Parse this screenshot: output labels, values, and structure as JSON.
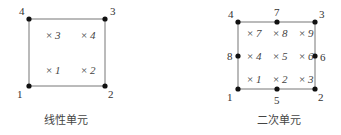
{
  "linear": {
    "caption": "线性单元",
    "nodes": [
      {
        "id": "1",
        "x": 29,
        "y": 86,
        "lx": 17,
        "ly": 98
      },
      {
        "id": "2",
        "x": 105,
        "y": 86,
        "lx": 108,
        "ly": 98
      },
      {
        "id": "3",
        "x": 105,
        "y": 19,
        "lx": 110,
        "ly": 15
      },
      {
        "id": "4",
        "x": 29,
        "y": 19,
        "lx": 19,
        "ly": 15
      }
    ],
    "integration_points": [
      {
        "id": "1",
        "x": 46,
        "y": 74
      },
      {
        "id": "2",
        "x": 81,
        "y": 74
      },
      {
        "id": "3",
        "x": 46,
        "y": 39
      },
      {
        "id": "4",
        "x": 81,
        "y": 39
      }
    ]
  },
  "quadratic": {
    "caption": "二次单元",
    "nodes": [
      {
        "id": "1",
        "x": 238,
        "y": 89,
        "lx": 227,
        "ly": 101
      },
      {
        "id": "2",
        "x": 315,
        "y": 89,
        "lx": 318,
        "ly": 101
      },
      {
        "id": "3",
        "x": 315,
        "y": 22,
        "lx": 319,
        "ly": 18
      },
      {
        "id": "4",
        "x": 238,
        "y": 22,
        "lx": 228,
        "ly": 18
      },
      {
        "id": "5",
        "x": 277,
        "y": 89,
        "lx": 274,
        "ly": 104
      },
      {
        "id": "6",
        "x": 315,
        "y": 56,
        "lx": 320,
        "ly": 61
      },
      {
        "id": "7",
        "x": 277,
        "y": 22,
        "lx": 274,
        "ly": 16
      },
      {
        "id": "8",
        "x": 238,
        "y": 56,
        "lx": 227,
        "ly": 60
      }
    ],
    "integration_points": [
      {
        "id": "1",
        "x": 247,
        "y": 83
      },
      {
        "id": "2",
        "x": 273,
        "y": 83
      },
      {
        "id": "3",
        "x": 299,
        "y": 83
      },
      {
        "id": "4",
        "x": 247,
        "y": 60
      },
      {
        "id": "5",
        "x": 273,
        "y": 60
      },
      {
        "id": "6",
        "x": 299,
        "y": 60
      },
      {
        "id": "7",
        "x": 247,
        "y": 37
      },
      {
        "id": "8",
        "x": 273,
        "y": 37
      },
      {
        "id": "9",
        "x": 299,
        "y": 37
      }
    ]
  },
  "colors": {
    "line": "#777777",
    "node": "#111111"
  }
}
